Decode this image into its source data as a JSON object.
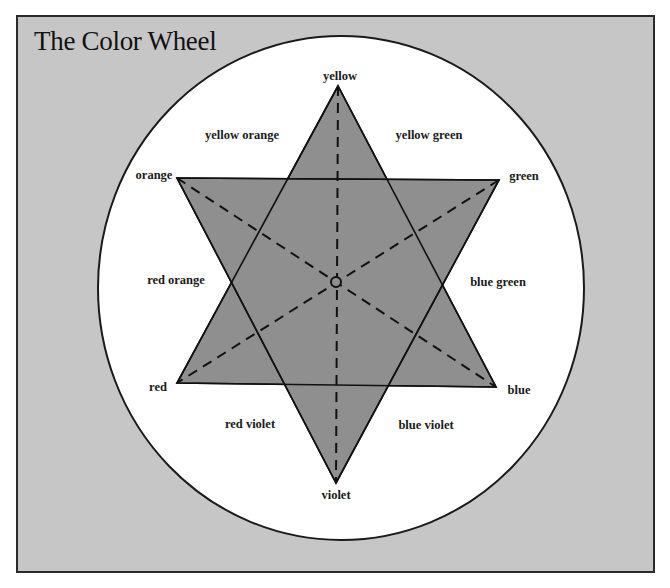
{
  "title": "The Color Wheel",
  "colors": {
    "background": "#c6c6c6",
    "circle_fill": "#ffffff",
    "star_fill": "#8f8f8f",
    "line": "#111111"
  },
  "wheel": {
    "ellipse": {
      "cx": 341,
      "cy": 288,
      "rx": 243,
      "ry": 252
    },
    "center_circle": {
      "cx": 336,
      "cy": 282,
      "r": 5
    }
  },
  "triangles": {
    "primary": {
      "name": "yellow-red-blue",
      "points": [
        [
          338,
          86
        ],
        [
          177,
          383
        ],
        [
          496,
          387
        ]
      ]
    },
    "secondary": {
      "name": "orange-green-violet",
      "points": [
        [
          177,
          178
        ],
        [
          499,
          180
        ],
        [
          336,
          483
        ]
      ]
    }
  },
  "dashed_axes": [
    {
      "from": "yellow",
      "to": "violet"
    },
    {
      "from": "orange",
      "to": "blue"
    },
    {
      "from": "green",
      "to": "red"
    }
  ],
  "labels": {
    "yellow": {
      "text": "yellow",
      "x": 340,
      "y": 76
    },
    "yellow_orange": {
      "text": "yellow orange",
      "x": 242,
      "y": 135
    },
    "yellow_green": {
      "text": "yellow green",
      "x": 429,
      "y": 135
    },
    "orange": {
      "text": "orange",
      "x": 154,
      "y": 175
    },
    "green": {
      "text": "green",
      "x": 524,
      "y": 176
    },
    "red_orange": {
      "text": "red orange",
      "x": 176,
      "y": 280
    },
    "blue_green": {
      "text": "blue green",
      "x": 498,
      "y": 282
    },
    "red": {
      "text": "red",
      "x": 158,
      "y": 387
    },
    "blue": {
      "text": "blue",
      "x": 519,
      "y": 390
    },
    "red_violet": {
      "text": "red violet",
      "x": 250,
      "y": 424
    },
    "blue_violet": {
      "text": "blue violet",
      "x": 426,
      "y": 425
    },
    "violet": {
      "text": "violet",
      "x": 336,
      "y": 495
    }
  }
}
